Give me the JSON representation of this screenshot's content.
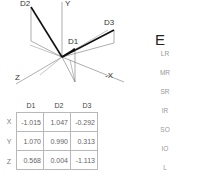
{
  "diagram": {
    "axis_labels": {
      "y": "Y",
      "z": "Z",
      "neg_x": "-X"
    },
    "vector_labels": {
      "d1": "D1",
      "d2": "D2",
      "d3": "D3"
    },
    "colors": {
      "axis": "#666666",
      "vector": "#111111",
      "projection": "#777777"
    }
  },
  "table": {
    "columns": [
      "D1",
      "D2",
      "D3"
    ],
    "rows": [
      {
        "label": "X",
        "values": [
          "-1.015",
          "1.047",
          "-0.292"
        ]
      },
      {
        "label": "Y",
        "values": [
          "1.070",
          "0.990",
          "0.313"
        ]
      },
      {
        "label": "Z",
        "values": [
          "0.568",
          "0.004",
          "-1.113"
        ]
      }
    ]
  },
  "right_panel": {
    "title": "E",
    "items": [
      "LR",
      "MR",
      "SR",
      "IR",
      "SO",
      "IO",
      "L"
    ]
  }
}
